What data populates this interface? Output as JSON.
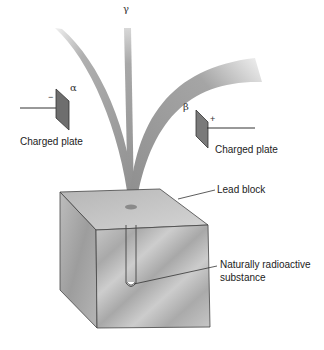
{
  "labels": {
    "gamma": "γ",
    "alpha": "α",
    "beta": "β",
    "minus": "−",
    "plus": "+",
    "left_plate": "Charged plate",
    "right_plate": "Charged plate",
    "lead_block": "Lead block",
    "substance_line1": "Naturally radioactive",
    "substance_line2": "substance"
  },
  "colors": {
    "beam": "#9a9a9a",
    "plate": "#6e6e6e",
    "block_front": "#b9b9b9",
    "block_top": "#cfcfcf",
    "block_side": "#a5a5a5",
    "lines": "#333333"
  }
}
